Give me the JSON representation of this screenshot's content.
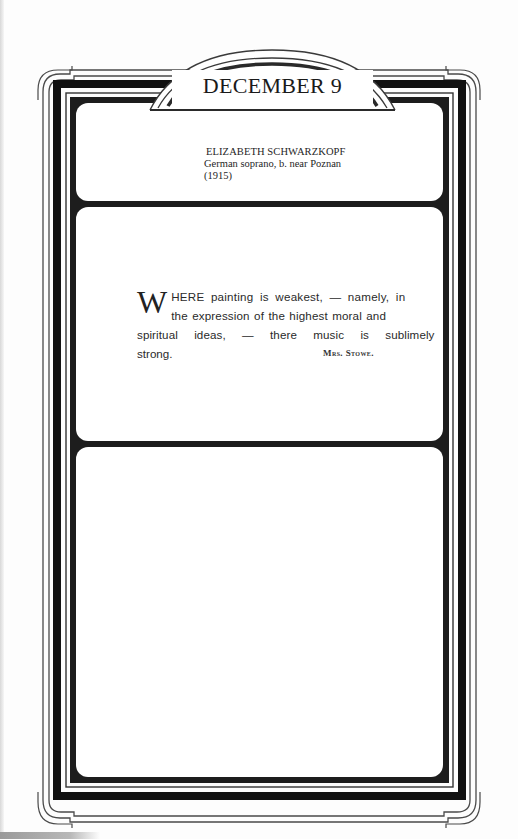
{
  "page": {
    "date_header": "DECEMBER 9",
    "birthday": {
      "name": "ELIZABETH SCHWARZKOPF",
      "description": "German soprano, b. near Poznan",
      "year": "(1915)"
    },
    "quote": {
      "dropcap": "W",
      "lines": [
        "HERE painting is weakest, — namely, in",
        "the expression of the highest moral and",
        "spiritual ideas, — there music is sublimely",
        "strong."
      ],
      "author": "Mrs. Stowe."
    },
    "notes_panel": {
      "content": ""
    }
  },
  "colors": {
    "ink": "#1a1a1a",
    "border_gray": "#555555",
    "paper": "#fdfdfd"
  }
}
